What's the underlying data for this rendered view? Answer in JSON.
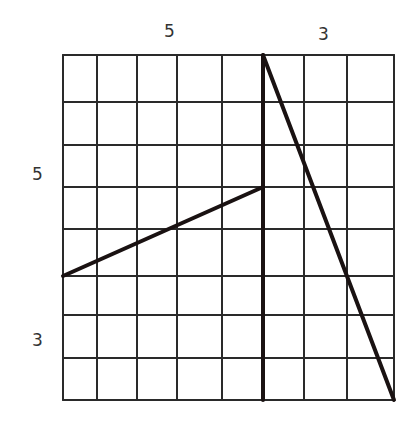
{
  "diagram": {
    "type": "grid-dissection",
    "grid": {
      "columns": 8,
      "rows": 8,
      "x_lines": [
        63,
        97,
        137,
        177,
        222,
        263,
        304,
        347,
        394
      ],
      "y_lines": [
        55,
        102,
        145,
        187,
        229,
        276,
        315,
        358,
        400
      ],
      "line_color": "#2a2a2a"
    },
    "labels": {
      "top_left": "5",
      "top_right": "3",
      "left_upper": "5",
      "left_lower": "3"
    },
    "cut_lines": [
      {
        "name": "vertical-divider",
        "x1": 263,
        "y1": 55,
        "x2": 263,
        "y2": 400
      },
      {
        "name": "left-slant",
        "x1": 63,
        "y1": 276,
        "x2": 263,
        "y2": 187
      },
      {
        "name": "right-diagonal",
        "x1": 263,
        "y1": 55,
        "x2": 394,
        "y2": 400
      }
    ],
    "cut_color": "#1a1212"
  }
}
